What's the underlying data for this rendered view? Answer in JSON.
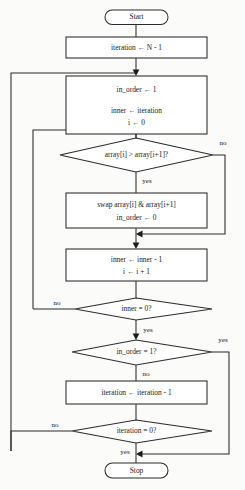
{
  "diagram": {
    "colors": {
      "background": "#fbfbf9",
      "stroke": "#2b2b2b",
      "text": "#1a1a1a",
      "shape_fill": "#ffffff"
    },
    "nodes": {
      "start": {
        "type": "terminal",
        "label": "Start"
      },
      "init_iteration": {
        "type": "process",
        "label": "iteration ← N - 1"
      },
      "init_pass": {
        "type": "process",
        "line1": "in_order ← 1",
        "line2": "inner ← iteration",
        "line3": "i ← 0"
      },
      "compare": {
        "type": "decision",
        "label": "array[i] > array[i+1]?"
      },
      "swap": {
        "type": "process",
        "line1": "swap array[i] & array[i+1]",
        "line2": "in_order ← 0"
      },
      "advance": {
        "type": "process",
        "line1": "inner ← inner - 1",
        "line2": "i ← i + 1"
      },
      "inner_check": {
        "type": "decision",
        "label": "inner = 0?"
      },
      "in_order_check": {
        "type": "decision",
        "label": "in_order = 1?"
      },
      "dec_iteration": {
        "type": "process",
        "label": "iteration ← iteration - 1"
      },
      "iteration_check": {
        "type": "decision",
        "label": "iteration = 0?"
      },
      "stop": {
        "type": "terminal",
        "label": "Stop"
      }
    },
    "edge_labels": {
      "compare_no": "no",
      "compare_yes": "yes",
      "inner_check_no": "no",
      "inner_check_yes": "yes",
      "in_order_yes": "yes",
      "in_order_no": "no",
      "iteration_check_no": "no",
      "iteration_check_yes": "yes"
    }
  }
}
